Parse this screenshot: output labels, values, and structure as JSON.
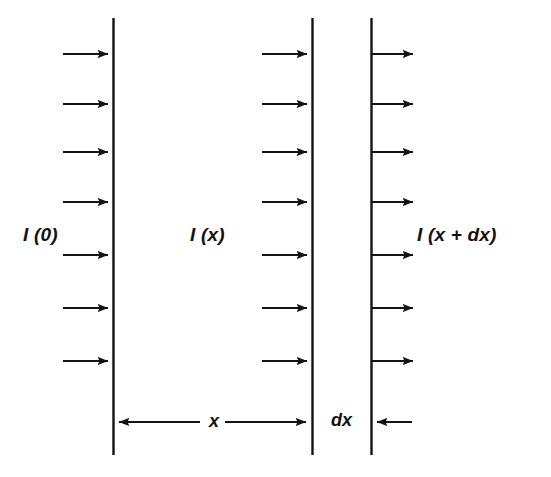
{
  "figure": {
    "domain": "diagram",
    "kind": "physics-optics-absorption-schematic",
    "background_color": "#ffffff",
    "stroke_color": "#131313",
    "width": 551,
    "height": 477
  },
  "labels": {
    "incident": "I (0)",
    "at_depth_x": "I (x)",
    "after_slab": "I (x + dx)",
    "distance_x": "x",
    "slab_thickness": "dx"
  },
  "geometry": {
    "planes": [
      {
        "name": "entrance-plane",
        "x": 113,
        "y_top": 18,
        "y_bottom": 455
      },
      {
        "name": "plane-at-x",
        "x": 312,
        "y_top": 18,
        "y_bottom": 455
      },
      {
        "name": "plane-at-x-plus-dx",
        "x": 371,
        "y_top": 18,
        "y_bottom": 455
      }
    ],
    "ray_rows_y": [
      54,
      104,
      152,
      202,
      255,
      308,
      361
    ],
    "ray_count_per_column": 7,
    "ray_columns": [
      {
        "name": "incident-rays",
        "x_start": 63,
        "x_end": 113
      },
      {
        "name": "rays-at-x",
        "x_start": 262,
        "x_end": 312
      },
      {
        "name": "rays-after-dx",
        "x_start": 371,
        "x_end": 418
      }
    ],
    "dimension_line_y": 422,
    "dimension_x": {
      "from": 113,
      "to": 312,
      "heads": "both"
    },
    "dimension_dx_arrow": {
      "from": 412,
      "to": 371,
      "heads": "left"
    }
  },
  "label_positions": {
    "incident": {
      "x": 23,
      "y": 225
    },
    "at_depth_x": {
      "x": 190,
      "y": 225
    },
    "after_slab": {
      "x": 417,
      "y": 225
    },
    "distance_x": {
      "x": 205,
      "y": 412
    },
    "slab_thickness": {
      "x": 327,
      "y": 411
    }
  },
  "icons": {
    "arrow_right": "arrow-right-icon",
    "arrow_left": "arrow-left-icon",
    "arrow_double": "arrow-double-horizontal-icon"
  }
}
